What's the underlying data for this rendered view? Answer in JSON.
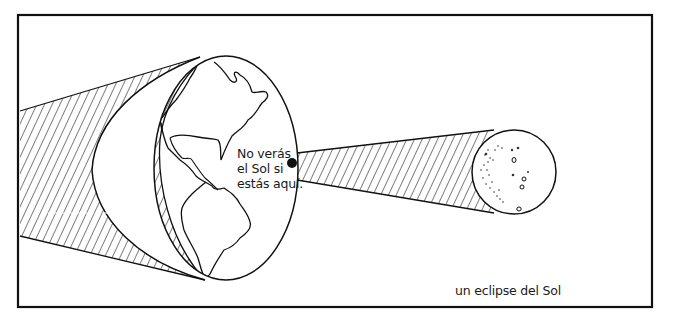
{
  "diagram": {
    "title": "un eclipse del Sol",
    "caption": "un eclipse del Sol",
    "earth_label": {
      "lines": [
        "No verás",
        "el Sol si",
        "estás aquí."
      ]
    },
    "elements": {
      "earth": "earth-globe showing the Americas",
      "moon": "moon with craters",
      "observer_point": "black dot on Earth's surface",
      "shadow_umbra": "hatched cone from Moon to Earth",
      "shadow_penumbra": "hatched region behind Earth"
    },
    "colors": {
      "stroke": "#111111",
      "background": "#ffffff",
      "text": "#1a1a1a"
    }
  }
}
